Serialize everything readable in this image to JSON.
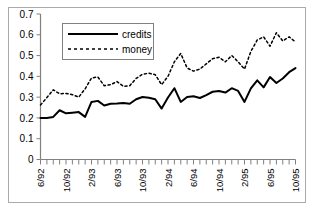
{
  "chart_data": {
    "type": "line",
    "title": "",
    "subtitle": "",
    "xlabel": "",
    "ylabel": "",
    "ylim": [
      0,
      0.7
    ],
    "ytick_labels": [
      "0",
      "0.1",
      "0.2",
      "0.3",
      "0.4",
      "0.5",
      "0.6",
      "0.7"
    ],
    "ytick_values": [
      0,
      0.1,
      0.2,
      0.3,
      0.4,
      0.5,
      0.6,
      0.7
    ],
    "grid": false,
    "legend_position": "top-left-inside",
    "x_tick_count": 41,
    "xtick_labels": [
      "6/92",
      "10/92",
      "2/93",
      "6/93",
      "10/93",
      "2/94",
      "6/94",
      "10/94",
      "2/95",
      "6/95",
      "10/95"
    ],
    "xtick_label_interval": 4,
    "x": [
      "6/92",
      "7/92",
      "8/92",
      "9/92",
      "10/92",
      "11/92",
      "12/92",
      "1/93",
      "2/93",
      "3/93",
      "4/93",
      "5/93",
      "6/93",
      "7/93",
      "8/93",
      "9/93",
      "10/93",
      "11/93",
      "12/93",
      "1/94",
      "2/94",
      "3/94",
      "4/94",
      "5/94",
      "6/94",
      "7/94",
      "8/94",
      "9/94",
      "10/94",
      "11/94",
      "12/94",
      "1/95",
      "2/95",
      "3/95",
      "4/95",
      "5/95",
      "6/95",
      "7/95",
      "8/95",
      "9/95",
      "10/95"
    ],
    "series": [
      {
        "name": "credits",
        "style": "solid",
        "color": "#000000",
        "values": [
          0.2,
          0.2,
          0.205,
          0.237,
          0.222,
          0.225,
          0.228,
          0.205,
          0.277,
          0.282,
          0.26,
          0.268,
          0.269,
          0.272,
          0.268,
          0.29,
          0.301,
          0.297,
          0.29,
          0.245,
          0.298,
          0.343,
          0.277,
          0.301,
          0.304,
          0.296,
          0.31,
          0.326,
          0.33,
          0.322,
          0.343,
          0.33,
          0.277,
          0.342,
          0.381,
          0.347,
          0.397,
          0.368,
          0.39,
          0.42,
          0.44
        ]
      },
      {
        "name": "money",
        "style": "dotted",
        "color": "#000000",
        "values": [
          0.262,
          0.298,
          0.335,
          0.316,
          0.318,
          0.312,
          0.3,
          0.34,
          0.392,
          0.397,
          0.355,
          0.36,
          0.375,
          0.352,
          0.355,
          0.39,
          0.41,
          0.415,
          0.408,
          0.36,
          0.4,
          0.47,
          0.51,
          0.44,
          0.425,
          0.435,
          0.46,
          0.485,
          0.492,
          0.47,
          0.5,
          0.47,
          0.435,
          0.52,
          0.575,
          0.59,
          0.545,
          0.61,
          0.57,
          0.59,
          0.565
        ]
      }
    ]
  },
  "legend": {
    "items": [
      {
        "label": "credits",
        "style": "solid"
      },
      {
        "label": "money",
        "style": "dotted"
      }
    ]
  }
}
